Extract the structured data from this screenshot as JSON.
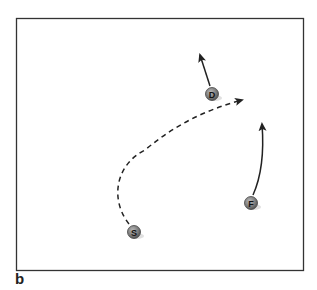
{
  "panel_label": "b",
  "colors": {
    "frame": "#333333",
    "arrow": "#222222",
    "marker_fill": "#7a7a7a",
    "marker_text": "#1a1a1a"
  },
  "players": [
    {
      "id": "D",
      "label": "D",
      "x": 212,
      "y": 94
    },
    {
      "id": "S",
      "label": "S",
      "x": 134,
      "y": 232
    },
    {
      "id": "F",
      "label": "F",
      "x": 251,
      "y": 203
    }
  ],
  "paths": [
    {
      "from": "D",
      "style": "solid",
      "description": "D moves up-left"
    },
    {
      "from": "S",
      "style": "dashed",
      "description": "S curves up and right toward area right of D"
    },
    {
      "from": "F",
      "style": "solid",
      "description": "F moves straight up with slight curve"
    }
  ]
}
